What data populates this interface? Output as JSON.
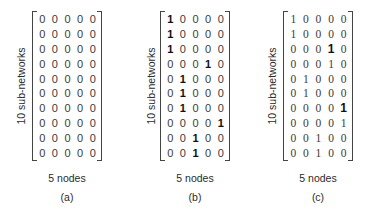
{
  "figure": {
    "panels": [
      {
        "id": "a",
        "ylabel": "10 sub-networks",
        "xlabel": "5 nodes",
        "caption": "(a)",
        "style": "sans",
        "matrix": [
          [
            0,
            0,
            0,
            0,
            0
          ],
          [
            0,
            0,
            0,
            0,
            0
          ],
          [
            0,
            0,
            0,
            0,
            0
          ],
          [
            0,
            0,
            0,
            0,
            0
          ],
          [
            0,
            0,
            0,
            0,
            0
          ],
          [
            0,
            0,
            0,
            0,
            0
          ],
          [
            0,
            0,
            0,
            0,
            0
          ],
          [
            0,
            0,
            0,
            0,
            0
          ],
          [
            0,
            0,
            0,
            0,
            0
          ],
          [
            0,
            0,
            0,
            0,
            0
          ]
        ],
        "bold_ones": []
      },
      {
        "id": "b",
        "ylabel": "10 sub-networks",
        "xlabel": "5 nodes",
        "caption": "(b)",
        "style": "sans",
        "matrix": [
          [
            1,
            0,
            0,
            0,
            0
          ],
          [
            1,
            0,
            0,
            0,
            0
          ],
          [
            1,
            0,
            0,
            0,
            0
          ],
          [
            0,
            0,
            0,
            1,
            0
          ],
          [
            0,
            1,
            0,
            0,
            0
          ],
          [
            0,
            1,
            0,
            0,
            0
          ],
          [
            0,
            1,
            0,
            0,
            0
          ],
          [
            0,
            0,
            0,
            0,
            1
          ],
          [
            0,
            0,
            1,
            0,
            0
          ],
          [
            0,
            0,
            1,
            0,
            0
          ]
        ],
        "bold_ones": [
          [
            0,
            0
          ],
          [
            1,
            0
          ],
          [
            2,
            0
          ],
          [
            3,
            3
          ],
          [
            4,
            1
          ],
          [
            5,
            1
          ],
          [
            6,
            1
          ],
          [
            7,
            4
          ],
          [
            8,
            2
          ],
          [
            9,
            2
          ]
        ]
      },
      {
        "id": "c",
        "ylabel": "10 sub-networks",
        "xlabel": "5 nodes",
        "caption": "(c)",
        "style": "serif",
        "matrix": [
          [
            1,
            0,
            0,
            0,
            0
          ],
          [
            1,
            0,
            0,
            0,
            0
          ],
          [
            0,
            0,
            0,
            1,
            0
          ],
          [
            0,
            0,
            0,
            1,
            0
          ],
          [
            0,
            1,
            0,
            0,
            0
          ],
          [
            0,
            1,
            0,
            0,
            0
          ],
          [
            0,
            0,
            0,
            0,
            1
          ],
          [
            0,
            0,
            0,
            0,
            1
          ],
          [
            0,
            0,
            1,
            0,
            0
          ],
          [
            0,
            0,
            1,
            0,
            0
          ]
        ],
        "bold_ones": [
          [
            2,
            3
          ],
          [
            6,
            4
          ]
        ]
      }
    ]
  }
}
